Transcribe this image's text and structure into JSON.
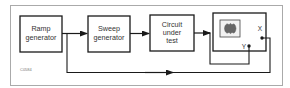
{
  "diagram": {
    "type": "block-diagram",
    "figure_code": "C0584",
    "blocks": [
      {
        "id": "ramp",
        "lines": [
          "Ramp",
          "generator"
        ]
      },
      {
        "id": "sweep",
        "lines": [
          "Sweep",
          "generator"
        ]
      },
      {
        "id": "cut",
        "lines": [
          "Circuit",
          "under",
          "test"
        ]
      },
      {
        "id": "scope",
        "lines": []
      }
    ],
    "scope_terminals": {
      "x_label": "X",
      "y_label": "Y"
    },
    "connections": [
      {
        "from": "ramp",
        "to": "sweep",
        "arrow": true
      },
      {
        "from": "sweep",
        "to": "cut",
        "arrow": true
      },
      {
        "from": "cut",
        "to": "scope.Y",
        "arrow": true
      },
      {
        "from": "ramp",
        "to": "scope.X",
        "arrow": true,
        "route": "bottom"
      }
    ],
    "colors": {
      "line": "#1a1a1a",
      "frame": "#aaaaaa",
      "screen_fill": "#f2f2f2",
      "trace": "#666666"
    }
  }
}
